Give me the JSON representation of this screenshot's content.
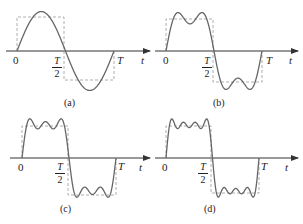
{
  "figure": {
    "panels": [
      {
        "id": "a",
        "caption": "(a)",
        "harmonics": "fundamental only",
        "origin_label": "0",
        "half_period_num": "T",
        "half_period_den": "2",
        "period_label": "T",
        "axis_label": "t"
      },
      {
        "id": "b",
        "caption": "(b)",
        "harmonics": "fundamental + 3rd",
        "origin_label": "0",
        "half_period_num": "T",
        "half_period_den": "2",
        "period_label": "T",
        "axis_label": "t"
      },
      {
        "id": "c",
        "caption": "(c)",
        "harmonics": "fundamental + 3rd + 5th",
        "origin_label": "0",
        "half_period_num": "T",
        "half_period_den": "2",
        "period_label": "T",
        "axis_label": "t"
      },
      {
        "id": "d",
        "caption": "(d)",
        "harmonics": "fundamental + 3rd + 5th + 7th",
        "origin_label": "0",
        "half_period_num": "T",
        "half_period_den": "2",
        "period_label": "T",
        "axis_label": "t"
      }
    ],
    "colors": {
      "curve": "#6b6b6b",
      "axis": "#333333",
      "dashed_square": "#999999"
    }
  }
}
